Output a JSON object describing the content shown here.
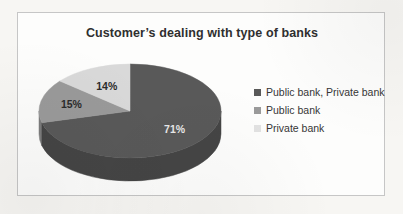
{
  "figure": {
    "background_color": "#f7f6f3",
    "frame_color": "#c6c6c6",
    "plot_background": "#fdfdfc"
  },
  "chart_data": {
    "type": "pie",
    "title": "Customer’s dealing with type of banks",
    "xlabel": "",
    "ylabel": "",
    "three_d": true,
    "start_angle_deg": 0,
    "direction": "clockwise",
    "categories": [
      "Public bank, Private bank",
      "Public bank",
      "Private bank"
    ],
    "values": [
      71,
      15,
      14
    ],
    "value_unit": "%",
    "data_labels": [
      "71%",
      "15%",
      "14%"
    ],
    "colors": [
      "#595959",
      "#9a9a9a",
      "#d9d9d9"
    ],
    "side_colors": [
      "#454545",
      "#7c7c7c",
      "#b4b4b4"
    ],
    "label_colors": [
      "#e8e8e8",
      "#2b2b2b",
      "#2b2b2b"
    ],
    "legend": {
      "position": "right",
      "entries": [
        {
          "label": "Public bank, Private bank",
          "color": "#595959"
        },
        {
          "label": "Public bank",
          "color": "#9a9a9a"
        },
        {
          "label": "Private bank",
          "color": "#e2e2e2"
        }
      ]
    }
  }
}
